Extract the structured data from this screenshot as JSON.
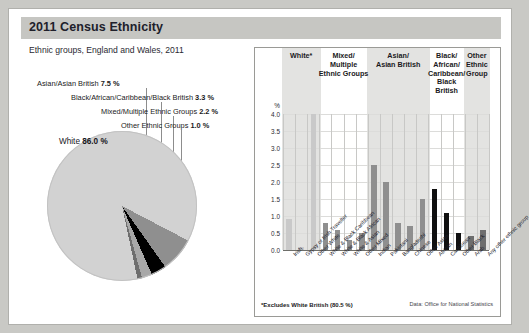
{
  "header": {
    "title": "2011 Census Ethnicity",
    "subtitle": "Ethnic groups, England and Wales, 2011"
  },
  "pie": {
    "main_label_name": "White",
    "main_label_value": "86.0 %",
    "callouts": [
      {
        "name": "Asian/Asian British",
        "value": "7.5 %"
      },
      {
        "name": "Black/African/Caribbean/Black British",
        "value": "3.3 %"
      },
      {
        "name": "Mixed/Multiple Ethnic Groups",
        "value": "2.2 %"
      },
      {
        "name": "Other Ethnic Groups",
        "value": "1.0 %"
      }
    ]
  },
  "bar_panel": {
    "footnote": "*Excludes White British (80.5 %)",
    "source": "Data: Office for National Statistics"
  },
  "chart_data": [
    {
      "type": "pie",
      "title": "Ethnic groups, England and Wales, 2011",
      "categories": [
        "White",
        "Asian/Asian British",
        "Black/African/Caribbean/Black British",
        "Mixed/Multiple Ethnic Groups",
        "Other Ethnic Groups"
      ],
      "values": [
        86.0,
        7.5,
        3.3,
        2.2,
        1.0
      ],
      "unit": "%",
      "colors": [
        "#d2d2d2",
        "#8f8f8f",
        "#000000",
        "#a8a8a8",
        "#6e6e6e"
      ],
      "legend": "inline-labels"
    },
    {
      "type": "bar",
      "title": "Ethnic groups, England and Wales, 2011",
      "xlabel": "",
      "ylabel": "%",
      "ylim": [
        0.0,
        4.0
      ],
      "yticks": [
        "0.0",
        "0.5",
        "1.0",
        "1.5",
        "2.0",
        "2.5",
        "3.0",
        "3.5",
        "4.0"
      ],
      "grid": true,
      "note": "*Excludes White British (80.5 %)",
      "groups": [
        {
          "label": "White*",
          "shaded": true,
          "color": "#c9c9c9",
          "categories": [
            "Irish",
            "Gypsy or Irish Traveller",
            "Other White"
          ],
          "values": [
            0.9,
            0.1,
            4.4
          ]
        },
        {
          "label": "Mixed/\nMultiple\nEthnic Groups",
          "shaded": false,
          "color": "#8f8f8f",
          "categories": [
            "White & Black Caribbean",
            "White & Black African",
            "White & Asian",
            "Other Mixed"
          ],
          "values": [
            0.8,
            0.6,
            0.3,
            0.5
          ]
        },
        {
          "label": "Asian/\nAsian British",
          "shaded": true,
          "color": "#8f8f8f",
          "categories": [
            "Indian",
            "Pakistani",
            "Bangladeshi",
            "Chinese",
            "Other Asian"
          ],
          "values": [
            2.5,
            2.0,
            0.8,
            0.7,
            1.5
          ]
        },
        {
          "label": "Black/\nAfrican/\nCaribbean/\nBlack British",
          "shaded": false,
          "color": "#101010",
          "categories": [
            "African",
            "Caribbean",
            "Other Black"
          ],
          "values": [
            1.8,
            1.1,
            0.5
          ]
        },
        {
          "label": "Other\nEthnic\nGroup",
          "shaded": true,
          "color": "#6e6e6e",
          "categories": [
            "Arab",
            "Any other ethnic group"
          ],
          "values": [
            0.4,
            0.6
          ]
        }
      ]
    }
  ]
}
